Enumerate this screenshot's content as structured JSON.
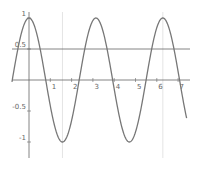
{
  "chart_data": {
    "type": "line",
    "title": "",
    "xlabel": "",
    "ylabel": "",
    "xlim": [
      -0.8,
      7.4
    ],
    "ylim": [
      -1.35,
      1.25
    ],
    "grid": false,
    "x_ticks": [
      1,
      2,
      3,
      4,
      5,
      6,
      7
    ],
    "x_tick_labels": [
      "1",
      "2",
      "3",
      "4",
      "5",
      "6",
      "7"
    ],
    "y_ticks": [
      1,
      0.5,
      -0.5,
      -1
    ],
    "y_tick_labels": [
      "1",
      "0.5",
      "-0.5",
      "-1"
    ],
    "series": [
      {
        "name": "y = cos(2x)",
        "function": "cos(2x)",
        "x_range": [
          -0.8,
          7.4
        ],
        "color": "#777777",
        "x": [
          -0.8,
          0,
          0.785,
          1.571,
          2.356,
          3.142,
          3.927,
          4.712,
          5.498,
          6.283,
          7.069,
          7.4
        ],
        "values": [
          -0.03,
          1,
          0,
          -1,
          0,
          1,
          0,
          -1,
          0,
          1,
          0,
          -0.61
        ]
      }
    ],
    "reference_lines": [
      {
        "orientation": "horizontal",
        "value": 0.5,
        "color": "#666666"
      },
      {
        "orientation": "vertical",
        "value": 1.571,
        "color": "#dddddd"
      },
      {
        "orientation": "vertical",
        "value": 6.283,
        "color": "#dddddd"
      }
    ],
    "legend": null
  }
}
